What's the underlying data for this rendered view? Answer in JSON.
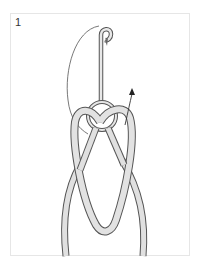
{
  "diagram": {
    "step_number": "1",
    "elements": [
      {
        "name": "fishing-hook",
        "description": "hook shank with eye at bottom and barbed point at top"
      },
      {
        "name": "line-loop",
        "description": "doubled line loop passed through hook eye"
      },
      {
        "name": "tag-ends",
        "description": "two line strands extending downward"
      },
      {
        "name": "motion-arrow",
        "description": "curved arrow indicating direction to pass loop"
      },
      {
        "name": "guide-curve",
        "description": "thin arc showing loop path over hook"
      }
    ],
    "colors": {
      "line_fill": "#d9d9d9",
      "line_outline": "#555555",
      "frame_border": "#e6e6e6",
      "arrow": "#222222"
    }
  }
}
